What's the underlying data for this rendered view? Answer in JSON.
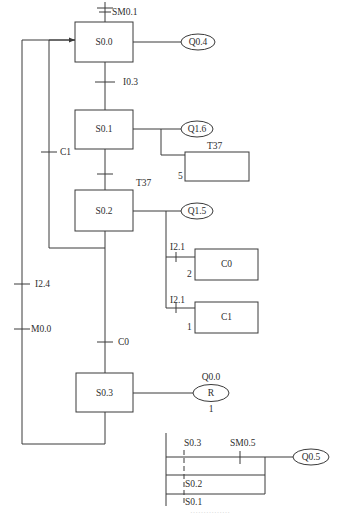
{
  "diagram": {
    "type": "sequential function chart with ladder output logic",
    "steps": [
      {
        "id": "S0.0",
        "label": "S0.0",
        "output": "Q0.4"
      },
      {
        "id": "S0.1",
        "label": "S0.1",
        "output": "Q1.6",
        "timer": {
          "label": "T37",
          "preset": "5"
        }
      },
      {
        "id": "S0.2",
        "label": "S0.2",
        "output": "Q1.5",
        "counters": [
          {
            "label": "C0",
            "input": "I2.1",
            "preset": "2"
          },
          {
            "label": "C1",
            "input": "I2.1",
            "preset": "1"
          }
        ]
      },
      {
        "id": "S0.3",
        "label": "S0.3",
        "reset_coil": {
          "address": "Q0.0",
          "symbol": "R",
          "count": "1"
        }
      }
    ],
    "transitions": {
      "initial": "SM0.1",
      "s00_to_s01": "I0.3",
      "s01_to_s02": "T37",
      "s02_to_s00": "C1",
      "s02_to_s03": "C0",
      "s03_to_s00_a": "I2.4",
      "s03_to_s00_b": "M0.0"
    },
    "ladder": {
      "contacts": [
        "S0.3",
        "SM0.5",
        "S0.2",
        "S0.1"
      ],
      "coil": "Q0.5"
    },
    "caption": "……………"
  }
}
